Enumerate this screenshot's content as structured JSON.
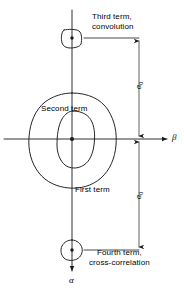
{
  "figure": {
    "kind": "technical-line-diagram",
    "stroke_color": "#1a1a1a",
    "background_color": "#ffffff"
  },
  "axes": {
    "horizontal": {
      "name": "beta-axis",
      "label": "β",
      "direction": "right",
      "y": 139,
      "x_start": 4,
      "x_end": 168
    },
    "vertical": {
      "name": "alpha-axis",
      "label": "α",
      "direction": "down",
      "x": 72,
      "y_start": 10,
      "y_end": 272
    },
    "origin": {
      "x": 72,
      "y": 139
    }
  },
  "terms": [
    {
      "id": "first-term",
      "label": "First term",
      "label_x": 75,
      "label_y": 185,
      "shape": "large-irregular-contour",
      "center": {
        "x": 72,
        "y": 139
      }
    },
    {
      "id": "second-term",
      "label": "Second term",
      "label_x": 41,
      "label_y": 104,
      "shape": "inner-irregular-contour",
      "center": {
        "x": 72,
        "y": 139
      }
    },
    {
      "id": "third-term",
      "label": "Third term,\nconvolution",
      "label_x": 92,
      "label_y": 12,
      "shape": "small-rounded-square-blob",
      "center": {
        "x": 72,
        "y": 38
      }
    },
    {
      "id": "fourth-term",
      "label": "Fourth term,\ncross-correlation",
      "label_x": 89,
      "label_y": 248,
      "shape": "small-pentagon-blob",
      "center": {
        "x": 72,
        "y": 250
      }
    }
  ],
  "dimensions": [
    {
      "id": "alpha-zero-upper",
      "label": "α",
      "subscript": "0",
      "orientation": "vertical",
      "x": 139,
      "y_top": 38,
      "y_bottom": 139,
      "arrowheads": "both"
    },
    {
      "id": "alpha-zero-lower",
      "label": "α",
      "subscript": "0",
      "orientation": "vertical",
      "x": 139,
      "y_top": 139,
      "y_bottom": 250,
      "arrowheads": "both"
    }
  ],
  "leaders": [
    {
      "id": "leader-top",
      "x_start": 85,
      "x_end": 139,
      "y": 38
    },
    {
      "id": "leader-bottom",
      "x_start": 85,
      "x_end": 139,
      "y": 250
    }
  ],
  "center_dots": [
    {
      "id": "origin-dot",
      "x": 72,
      "y": 139,
      "r": 2.1
    },
    {
      "id": "third-term-dot",
      "x": 72,
      "y": 38,
      "r": 1.7
    },
    {
      "id": "fourth-term-dot",
      "x": 72,
      "y": 250,
      "r": 1.7
    }
  ]
}
